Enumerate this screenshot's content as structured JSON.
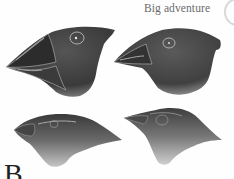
{
  "header": {
    "running_title": "Big adventure"
  },
  "figure": {
    "birds": [
      {
        "position": "top-left",
        "beak": "large heavy seed-cracking beak"
      },
      {
        "position": "top-right",
        "beak": "medium conical beak"
      },
      {
        "position": "bottom-left",
        "beak": "small conical beak"
      },
      {
        "position": "bottom-right",
        "beak": "slender pointed beak"
      }
    ]
  },
  "body": {
    "drop_cap": "B"
  },
  "colors": {
    "ink": "#2b2b2b",
    "header_text": "#6a6a6a",
    "background": "#ffffff"
  }
}
